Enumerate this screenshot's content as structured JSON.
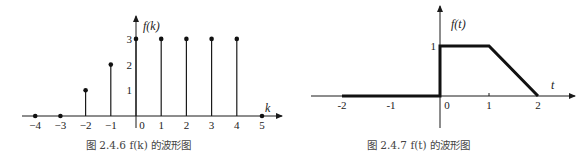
{
  "chart_data": [
    {
      "type": "stem",
      "title": "图 2.4.6    f(k) 的波形图",
      "xlabel": "k",
      "ylabel": "f(k)",
      "x": [
        -4,
        -3,
        -2,
        -1,
        0,
        1,
        2,
        3,
        4,
        5
      ],
      "values": [
        0,
        0,
        1,
        2,
        3,
        3,
        3,
        3,
        3,
        0
      ],
      "x_ticks": [
        "-4",
        "-3",
        "-2",
        "-1",
        "0",
        "1",
        "2",
        "3",
        "4",
        "5"
      ],
      "y_ticks": [
        "1",
        "2",
        "3"
      ],
      "xlim": [
        -4.5,
        5.8
      ],
      "ylim": [
        -0.6,
        3.9
      ],
      "grid": false,
      "legend": null
    },
    {
      "type": "line",
      "title": "图 2.4.7    f(t) 的波形图",
      "xlabel": "t",
      "ylabel": "f(t)",
      "x": [
        -2,
        0,
        0,
        1,
        2
      ],
      "values": [
        0,
        0,
        1,
        1,
        0
      ],
      "x_ticks": [
        "-2",
        "-1",
        "0",
        "1",
        "2"
      ],
      "y_ticks": [
        "1"
      ],
      "xlim": [
        -2.8,
        2.6
      ],
      "ylim": [
        -0.6,
        1.8
      ],
      "grid": false,
      "legend": null
    }
  ],
  "captions": {
    "left": "图 2.4.6    f(k) 的波形图",
    "right": "图 2.4.7    f(t) 的波形图"
  },
  "axis_labels": {
    "left_y": "f(k)",
    "left_x": "k",
    "right_y": "f(t)",
    "right_x": "t"
  },
  "colors": {
    "ink": "#1a1a1a",
    "caption": "#444444"
  }
}
